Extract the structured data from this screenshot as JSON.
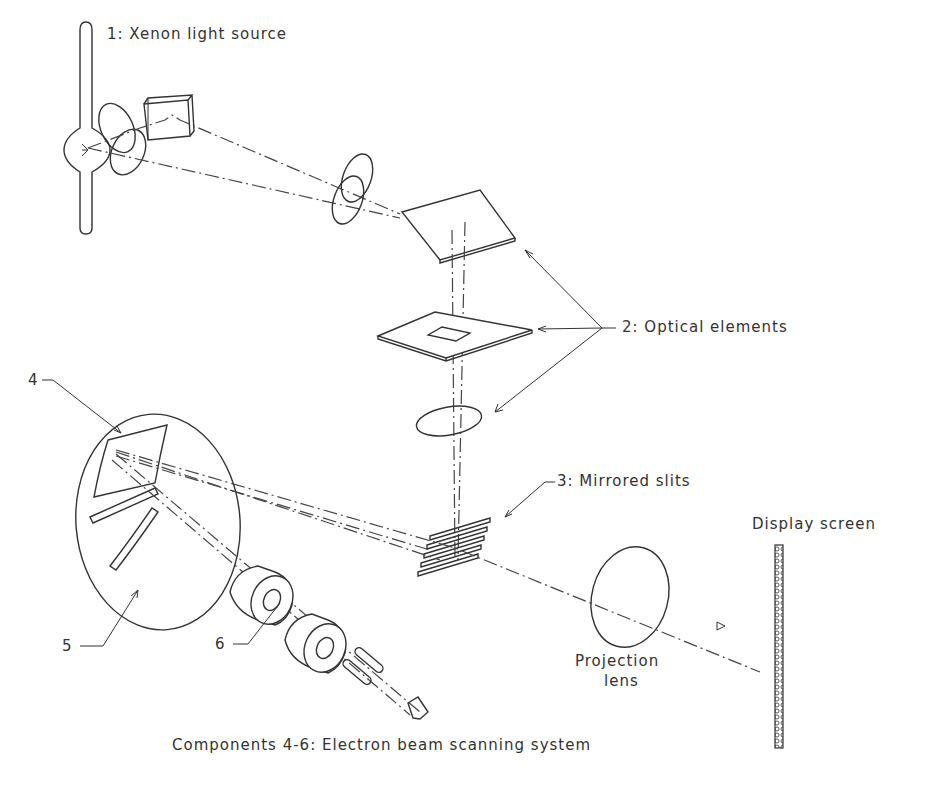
{
  "diagram": {
    "type": "optical-system-schematic",
    "labels": {
      "light_source": "1:  Xenon light source",
      "optical_elements": "2: Optical elements",
      "mirrored_slits": "3: Mirrored slits",
      "component_4": "4",
      "component_5": "5",
      "component_6": "6",
      "display_screen": "Display screen",
      "projection_lens_line1": "Projection",
      "projection_lens_line2": "lens",
      "caption": "Components 4-6:  Electron beam scanning system"
    },
    "components": [
      {
        "id": 1,
        "name": "Xenon light source"
      },
      {
        "id": 2,
        "name": "Optical elements"
      },
      {
        "id": 3,
        "name": "Mirrored slits"
      },
      {
        "id": 4,
        "name": "Component 4"
      },
      {
        "id": 5,
        "name": "Component 5"
      },
      {
        "id": 6,
        "name": "Component 6"
      },
      {
        "id": "screen",
        "name": "Display screen"
      },
      {
        "id": "lens",
        "name": "Projection lens"
      }
    ],
    "colors": {
      "line": "#333333",
      "background": "#ffffff"
    }
  }
}
